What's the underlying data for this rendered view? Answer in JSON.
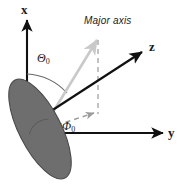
{
  "figure": {
    "type": "vector-geometry-diagram",
    "background_color": "#ffffff",
    "width": 183,
    "height": 189
  },
  "axes": [
    {
      "id": "x-axis",
      "label": "x",
      "direction": "vertical-up",
      "color": "#111111",
      "arrow": true
    },
    {
      "id": "y-axis",
      "label": "y",
      "direction": "horizontal-right",
      "color": "#111111",
      "arrow": true
    },
    {
      "id": "z-axis",
      "label": "z",
      "direction": "diagonal-upper-right",
      "color": "#111111",
      "arrow": true
    }
  ],
  "angles": [
    {
      "id": "theta",
      "symbol": "Θ",
      "subscript": "0",
      "description": "polar angle measured from the x-axis to the major axis",
      "color": "#1a1a1a"
    },
    {
      "id": "phi",
      "symbol": "Φ",
      "subscript": "0",
      "description": "azimuthal angle measured from the y-axis to the projection of the major axis",
      "color": "#1a1a1a"
    }
  ],
  "annotations": [
    {
      "id": "major-axis-label",
      "text": "Major axis",
      "style": "italic",
      "color": "#1a1a1a"
    }
  ],
  "shapes": [
    {
      "id": "disk",
      "kind": "ellipse",
      "fill_color": "#6e6e6e",
      "edge_color": "#4a4a4a",
      "rotation_deg": -27,
      "description": "shaded tilted disk centred on the origin"
    },
    {
      "id": "major-axis-line",
      "kind": "line",
      "color": "#c9c9c9",
      "style": "solid",
      "arrow": true,
      "description": "light grey line along the disk major axis"
    },
    {
      "id": "projection-vertical",
      "kind": "line",
      "color": "#b4b4b4",
      "style": "dashed",
      "description": "vertical dashed drop line from the major axis tip to the y-z plane"
    },
    {
      "id": "projection-horizontal",
      "kind": "line",
      "color": "#9a9a9a",
      "style": "dashed",
      "arrow": true,
      "description": "dashed arrow from the origin toward the projected point in the y-z plane"
    }
  ],
  "colors": {
    "axis": "#111111",
    "disk_fill": "#6e6e6e",
    "disk_edge": "#4a4a4a",
    "major_axis": "#c9c9c9",
    "dashed": "#b4b4b4",
    "text": "#1a1a1a",
    "background": "#ffffff"
  }
}
